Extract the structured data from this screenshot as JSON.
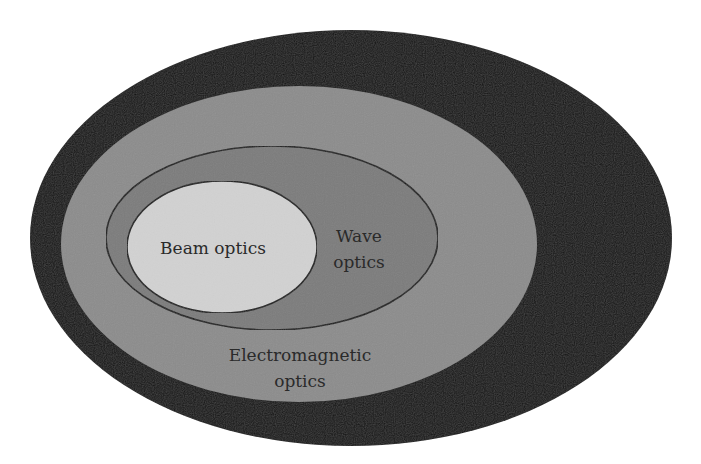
{
  "diagram": {
    "type": "nested-venn",
    "regions": [
      {
        "id": "quantum",
        "label": "",
        "fill": "#141414",
        "ellipse": {
          "cx": 351,
          "cy": 238,
          "rx": 321,
          "ry": 208
        }
      },
      {
        "id": "electromagnetic",
        "label_lines": [
          "Electromagnetic",
          "optics"
        ],
        "fill": "#8c8c8c",
        "ellipse": {
          "cx": 299,
          "cy": 244,
          "rx": 238,
          "ry": 158
        }
      },
      {
        "id": "wave",
        "label_lines": [
          "Wave",
          "optics"
        ],
        "fill": "#7b7b7b",
        "stroke": "#1e1e1e",
        "ellipse": {
          "cx": 272,
          "cy": 238,
          "rx": 166,
          "ry": 92
        }
      },
      {
        "id": "beam",
        "label": "Beam optics",
        "fill": "#d2d2d2",
        "stroke": "#1e1e1e",
        "ellipse": {
          "cx": 222,
          "cy": 247,
          "rx": 95,
          "ry": 66
        }
      }
    ],
    "labels": {
      "beam": "Beam optics",
      "wave_line1": "Wave",
      "wave_line2": "optics",
      "em_line1": "Electromagnetic",
      "em_line2": "optics"
    }
  }
}
